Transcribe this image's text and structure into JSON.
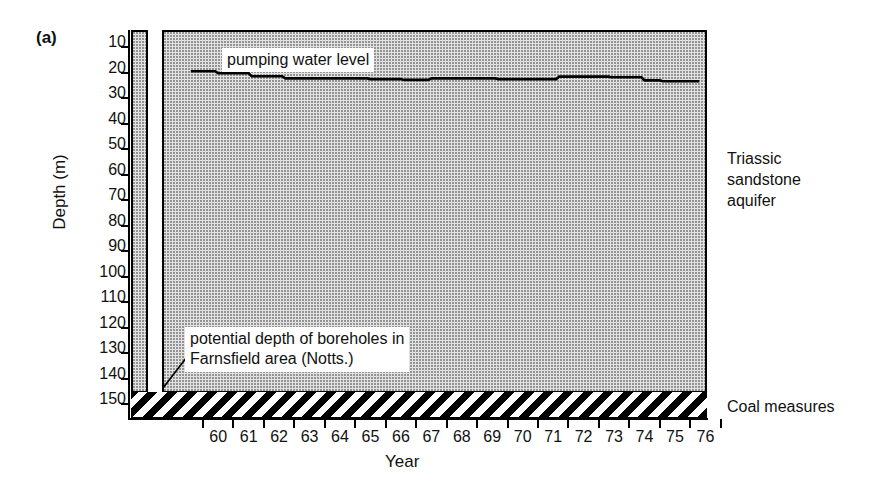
{
  "figure": {
    "panel_letter": "(a)"
  },
  "chart_data": {
    "type": "line",
    "title": "",
    "xlabel": "Year",
    "ylabel": "Depth (m)",
    "ylim": [
      0,
      155
    ],
    "y_inverted": true,
    "yticks": [
      10,
      20,
      30,
      40,
      50,
      60,
      70,
      80,
      90,
      100,
      110,
      120,
      130,
      140,
      150
    ],
    "ytick_labels": [
      "10",
      "20",
      "30",
      "40",
      "50",
      "60",
      "70",
      "80",
      "90",
      "100",
      "110",
      "120",
      "130",
      "140",
      "150"
    ],
    "xticks": [
      "60",
      "61",
      "62",
      "63",
      "64",
      "65",
      "66",
      "67",
      "68",
      "69",
      "70",
      "71",
      "72",
      "73",
      "74",
      "75",
      "76"
    ],
    "xtick_labels": [
      "60",
      "61",
      "62",
      "63",
      "64",
      "65",
      "66",
      "67",
      "68",
      "69",
      "70",
      "71",
      "72",
      "73",
      "74",
      "75",
      "76"
    ],
    "grid": false,
    "legend": "none",
    "series": [
      {
        "name": "pumping water level",
        "style": "step",
        "color": "#000000",
        "x": [
          "59.6",
          "60.4",
          "60.5",
          "61.5",
          "61.6",
          "62.6",
          "62.7",
          "65.4",
          "65.5",
          "66.5",
          "66.6",
          "67.4",
          "67.5",
          "69.6",
          "69.7",
          "71.6",
          "71.7",
          "73.3",
          "73.4",
          "74.4",
          "74.5",
          "75.0",
          "75.1",
          "76.3"
        ],
        "y": [
          19.5,
          19.5,
          20.3,
          20.3,
          21.5,
          21.5,
          22.3,
          22.3,
          22.6,
          22.6,
          22.9,
          22.9,
          22.3,
          22.3,
          22.6,
          22.6,
          21.6,
          21.6,
          21.9,
          21.9,
          23.1,
          23.1,
          23.4,
          23.4
        ]
      }
    ],
    "annotations": [
      {
        "name": "pumping-water-level",
        "text": "pumping water level"
      },
      {
        "name": "potential-borehole-depth",
        "line1": "potential depth of boreholes in",
        "line2": "Farnsfield area (Notts.)"
      }
    ],
    "regions": [
      {
        "name": "triassic-sandstone-aquifer",
        "label_line1": "Triassic",
        "label_line2": "sandstone",
        "label_line3": "aquifer",
        "fill": "stipple",
        "color": "#e2e2e2"
      },
      {
        "name": "coal-measures",
        "label": "Coal measures",
        "fill": "diagonal-hatch",
        "color": "#000000"
      }
    ]
  }
}
